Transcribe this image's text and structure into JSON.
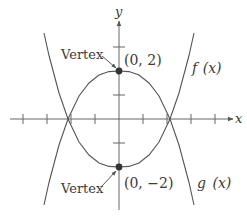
{
  "figure": {
    "axes": {
      "x_label": "x",
      "y_label": "y",
      "origin_px": [
        119,
        119
      ],
      "unit_px": 24,
      "x_ticks": [
        -4,
        -3,
        -2,
        -1,
        1,
        2,
        3,
        4
      ],
      "y_ticks": [
        -1,
        1,
        3
      ]
    },
    "curves": [
      {
        "name": "f",
        "label": "f (x)",
        "opens": "up",
        "vertex": [
          0,
          -2
        ],
        "points_px": [
          [
            44,
            33
          ],
          [
            49,
            55.5
          ],
          [
            59,
            93
          ],
          [
            68,
            119
          ],
          [
            79,
            142
          ],
          [
            89,
            155
          ],
          [
            99,
            163
          ],
          [
            109,
            166.4
          ],
          [
            119,
            167
          ],
          [
            129,
            166.4
          ],
          [
            139,
            163
          ],
          [
            149,
            155
          ],
          [
            159,
            142
          ],
          [
            170,
            119
          ],
          [
            179,
            93
          ],
          [
            189,
            55.5
          ],
          [
            194,
            33
          ]
        ]
      },
      {
        "name": "g",
        "label": "g (x)",
        "opens": "down",
        "vertex": [
          0,
          2
        ],
        "points_px": [
          [
            44,
            205
          ],
          [
            49,
            182.5
          ],
          [
            59,
            145
          ],
          [
            68,
            119
          ],
          [
            79,
            96
          ],
          [
            89,
            83
          ],
          [
            99,
            75
          ],
          [
            109,
            71.6
          ],
          [
            119,
            71
          ],
          [
            129,
            71.6
          ],
          [
            139,
            75
          ],
          [
            149,
            83
          ],
          [
            159,
            96
          ],
          [
            170,
            119
          ],
          [
            179,
            145
          ],
          [
            189,
            182.5
          ],
          [
            194,
            205
          ]
        ]
      }
    ],
    "annotations": {
      "top_vertex_label": "Vertex",
      "top_vertex_coords": "(0, 2)",
      "bottom_vertex_label": "Vertex",
      "bottom_vertex_coords": "(0, −2)",
      "f_label_left": "f",
      "f_label_right": "(x)",
      "g_label_left": "g",
      "g_label_right": "(x)"
    },
    "colors": {
      "line": "#555555",
      "dot": "#333333",
      "text": "#3a3a3a"
    }
  }
}
